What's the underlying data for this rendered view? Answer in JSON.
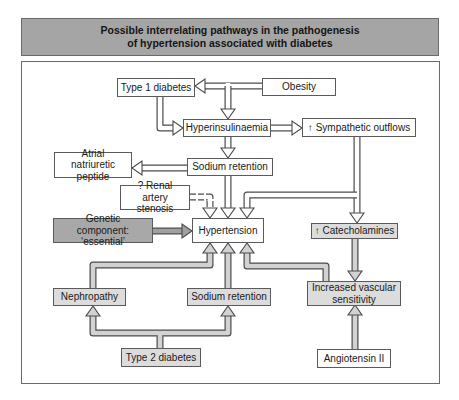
{
  "title": {
    "line1": "Possible interrelating pathways in the pathogenesis",
    "line2": "of hypertension associated with diabetes"
  },
  "colors": {
    "title_bar": "#a5a5a5",
    "dark_box": "#a8a8a8",
    "light_box": "#dcdcdc",
    "white_box": "#ffffff",
    "outline": "#5a5a5a"
  },
  "nodes": {
    "type1_diabetes": "Type 1 diabetes",
    "obesity": "Obesity",
    "hyperinsulinaemia": "Hyperinsulinaemia",
    "sympathetic_outflows": "↑ Sympathetic outflows",
    "atrial_natriuretic_peptide": "Atrial natriuretic peptide",
    "sodium_retention_upper": "Sodium retention",
    "renal_artery_stenosis": "? Renal artery stenosis",
    "genetic_component": "Genetic component: ‘essential’",
    "hypertension": "Hypertension",
    "catecholamines": "↑ Catecholamines",
    "nephropathy": "Nephropathy",
    "sodium_retention_lower": "Sodium retention",
    "increased_vascular_sensitivity": "Increased vascular sensitivity",
    "type2_diabetes": "Type 2 diabetes",
    "angiotensin_ii": "Angiotensin II"
  },
  "edges": [
    {
      "from": "Obesity",
      "to": "Type 1 diabetes"
    },
    {
      "from": "Obesity",
      "to": "Hyperinsulinaemia"
    },
    {
      "from": "Type 1 diabetes",
      "to": "Hyperinsulinaemia"
    },
    {
      "from": "Hyperinsulinaemia",
      "to": "↑ Sympathetic outflows"
    },
    {
      "from": "Hyperinsulinaemia",
      "to": "Sodium retention"
    },
    {
      "from": "Sodium retention",
      "to": "Atrial natriuretic peptide"
    },
    {
      "from": "Sodium retention",
      "to": "Hypertension"
    },
    {
      "from": "? Renal artery stenosis",
      "to": "Hypertension",
      "style": "dashed"
    },
    {
      "from": "↑ Sympathetic outflows",
      "to": "Hypertension"
    },
    {
      "from": "↑ Sympathetic outflows",
      "to": "↑ Catecholamines"
    },
    {
      "from": "Genetic component: ‘essential’",
      "to": "Hypertension"
    },
    {
      "from": "↑ Catecholamines",
      "to": "Increased vascular sensitivity"
    },
    {
      "from": "Increased vascular sensitivity",
      "to": "Hypertension"
    },
    {
      "from": "Angiotensin II",
      "to": "Increased vascular sensitivity"
    },
    {
      "from": "Nephropathy",
      "to": "Hypertension"
    },
    {
      "from": "Sodium retention",
      "to": "Hypertension"
    },
    {
      "from": "Type 2 diabetes",
      "to": "Nephropathy"
    },
    {
      "from": "Type 2 diabetes",
      "to": "Sodium retention"
    }
  ]
}
